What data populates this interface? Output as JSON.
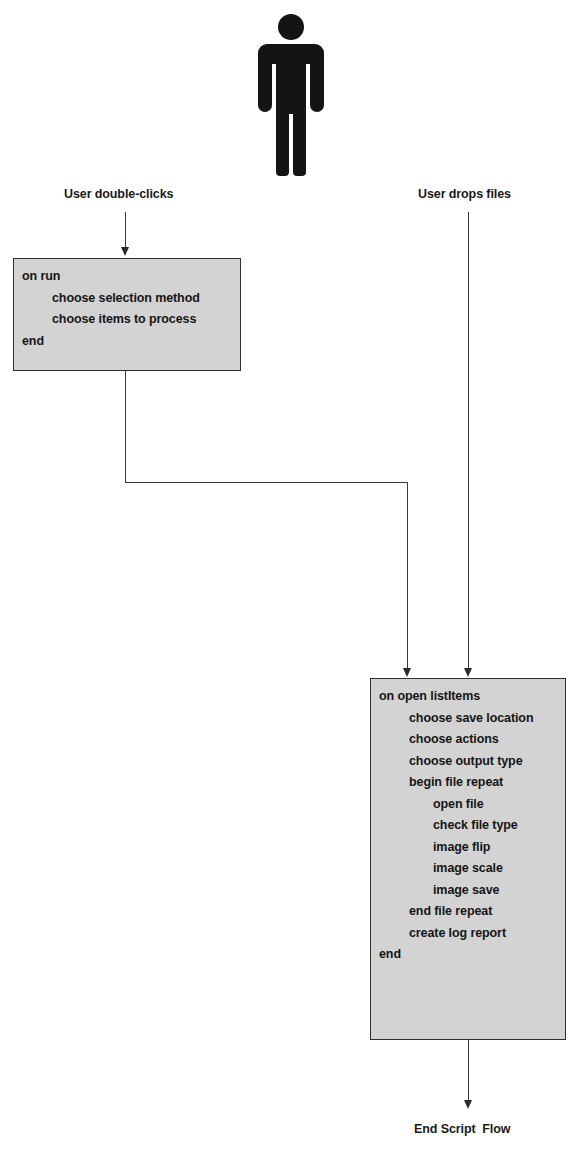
{
  "diagram": {
    "title": "Script Flow",
    "actor": {
      "name": "user-figure",
      "icon": "person-icon"
    },
    "entry_labels": {
      "left": "User double-clicks",
      "right": "User drops files"
    },
    "end_label": "End Script  Flow",
    "boxes": [
      {
        "id": "on-run-handler",
        "lines": [
          {
            "text": "on run",
            "indent": 0
          },
          {
            "text": "choose selection method",
            "indent": 1
          },
          {
            "text": "choose items to process",
            "indent": 1
          },
          {
            "text": "end",
            "indent": 0
          }
        ]
      },
      {
        "id": "on-open-handler",
        "lines": [
          {
            "text": "on open listItems",
            "indent": 0
          },
          {
            "text": "choose save location",
            "indent": 1
          },
          {
            "text": "choose actions",
            "indent": 1
          },
          {
            "text": "choose output type",
            "indent": 1
          },
          {
            "text": "begin file repeat",
            "indent": 1
          },
          {
            "text": "open file",
            "indent": 2
          },
          {
            "text": "check file type",
            "indent": 2
          },
          {
            "text": "image flip",
            "indent": 2
          },
          {
            "text": "image scale",
            "indent": 2
          },
          {
            "text": "image save",
            "indent": 2
          },
          {
            "text": "end file repeat",
            "indent": 1
          },
          {
            "text": "create log report",
            "indent": 1
          },
          {
            "text": "end",
            "indent": 0
          }
        ]
      }
    ],
    "colors": {
      "box_fill": "#d3d3d3",
      "box_border": "#2f2f2f",
      "line": "#3a3a3a",
      "text": "#161616",
      "actor": "#141414"
    }
  }
}
